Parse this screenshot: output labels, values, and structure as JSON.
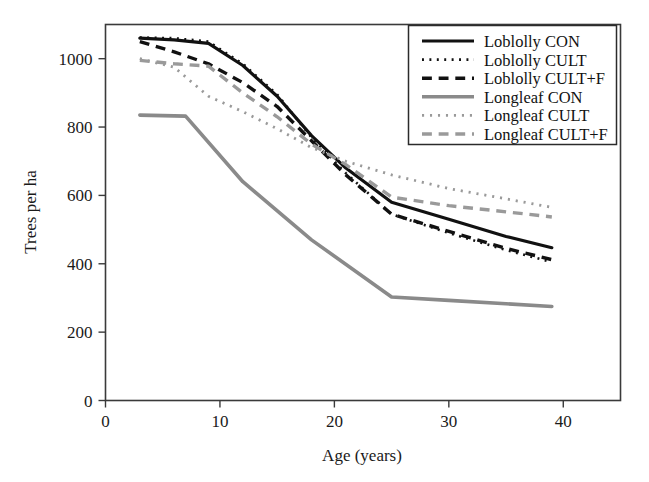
{
  "chart_data": {
    "type": "line",
    "title": "",
    "xlabel": "Age (years)",
    "ylabel": "Trees per ha",
    "xlim": [
      0,
      45
    ],
    "ylim": [
      0,
      1100
    ],
    "xticks": [
      0,
      10,
      20,
      30,
      40
    ],
    "yticks": [
      0,
      200,
      400,
      600,
      800,
      1000
    ],
    "xtick_labels": [
      "0",
      "10",
      "20",
      "30",
      "40"
    ],
    "ytick_labels": [
      "0",
      "200",
      "400",
      "600",
      "800",
      "1000"
    ],
    "grid": false,
    "legend_position": "upper right",
    "series": [
      {
        "name": "Loblolly CON",
        "style": "solid",
        "color": "#111111",
        "width": 3.2,
        "x": [
          3,
          6,
          9,
          12,
          15,
          18,
          21,
          25,
          30,
          35,
          39
        ],
        "y": [
          1060,
          1055,
          1045,
          980,
          890,
          775,
          680,
          580,
          530,
          480,
          447
        ]
      },
      {
        "name": "Loblolly CULT",
        "style": "dotted",
        "color": "#111111",
        "width": 2.6,
        "x": [
          3,
          6,
          9,
          12,
          15,
          18,
          21,
          25,
          30,
          35,
          39
        ],
        "y": [
          1062,
          1060,
          1050,
          985,
          895,
          770,
          665,
          545,
          490,
          440,
          405
        ]
      },
      {
        "name": "Loblolly CULT+F",
        "style": "dashed",
        "color": "#111111",
        "width": 3.4,
        "x": [
          3,
          6,
          9,
          12,
          15,
          18,
          21,
          25,
          30,
          35,
          39
        ],
        "y": [
          1050,
          1020,
          985,
          930,
          860,
          760,
          660,
          545,
          495,
          445,
          412
        ]
      },
      {
        "name": "Longleaf CON",
        "style": "solid",
        "color": "#8a8a8a",
        "width": 3.6,
        "x": [
          3,
          7,
          12,
          18,
          25,
          30,
          35,
          39
        ],
        "y": [
          835,
          832,
          640,
          470,
          303,
          293,
          283,
          275
        ]
      },
      {
        "name": "Longleaf CULT",
        "style": "dotted",
        "color": "#9a9a9a",
        "width": 2.8,
        "x": [
          3,
          6,
          9,
          12,
          15,
          18,
          21,
          25,
          30,
          35,
          39
        ],
        "y": [
          1000,
          975,
          890,
          845,
          795,
          740,
          700,
          660,
          620,
          590,
          565
        ]
      },
      {
        "name": "Longleaf CULT+F",
        "style": "dashed",
        "color": "#9a9a9a",
        "width": 3.4,
        "x": [
          3,
          6,
          9,
          12,
          15,
          18,
          21,
          25,
          30,
          35,
          39
        ],
        "y": [
          995,
          985,
          978,
          900,
          830,
          750,
          690,
          595,
          570,
          552,
          537
        ]
      }
    ]
  },
  "axes": {
    "xlabel": "Age (years)",
    "ylabel": "Trees per ha",
    "xtick_labels": [
      "0",
      "10",
      "20",
      "30",
      "40"
    ],
    "ytick_labels": [
      "0",
      "200",
      "400",
      "600",
      "800",
      "1000"
    ]
  },
  "legend": {
    "entries": [
      {
        "label": "Loblolly CON",
        "style": "solid",
        "color": "#111111"
      },
      {
        "label": "Loblolly CULT",
        "style": "dotted",
        "color": "#111111"
      },
      {
        "label": "Loblolly CULT+F",
        "style": "dashed",
        "color": "#111111"
      },
      {
        "label": "Longleaf CON",
        "style": "solid",
        "color": "#8a8a8a"
      },
      {
        "label": "Longleaf CULT",
        "style": "dotted",
        "color": "#9a9a9a"
      },
      {
        "label": "Longleaf CULT+F",
        "style": "dashed",
        "color": "#9a9a9a"
      }
    ]
  }
}
